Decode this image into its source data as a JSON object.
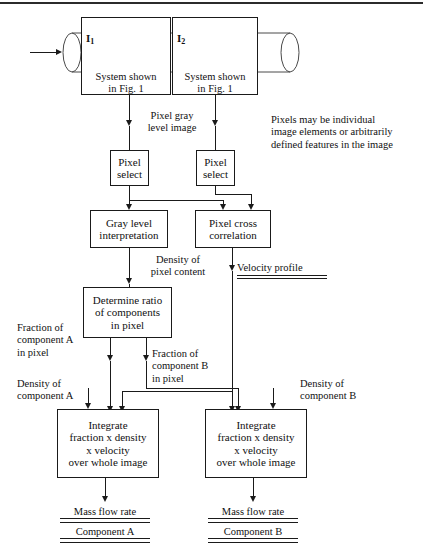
{
  "diagram": {
    "pipe": {
      "inlet_arrow": "flow-inlet-arrow",
      "bubble_left": "bubble-glyph",
      "bubble_right": "bubble-glyph"
    },
    "plane_labels": {
      "left": "I",
      "left_sub": "1",
      "right": "I",
      "right_sub": "2"
    },
    "boxes": {
      "system_left": "System shown\nin Fig. 1",
      "system_right": "System shown\nin Fig. 1",
      "pixel_select_left": "Pixel\nselect",
      "pixel_select_right": "Pixel\nselect",
      "gray_level": "Gray level\ninterpretation",
      "pixel_cross": "Pixel cross\ncorrelation",
      "determine_ratio": "Determine ratio\nof components\nin pixel",
      "integrate_left": "Integrate\nfraction x density\nx velocity\nover whole image",
      "integrate_right": "Integrate\nfraction x density\nx velocity\nover whole image"
    },
    "labels": {
      "pixel_gray_level_image": "Pixel gray\nlevel image",
      "note_pixels": "Pixels may be individual\nimage elements or arbitrarily\ndefined features in the image",
      "density_pixel_content": "Density of\npixel content",
      "velocity_profile": "Velocity profile",
      "fraction_a": "Fraction of\ncomponent A\nin pixel",
      "fraction_b": "Fraction of\ncomponent B\nin pixel",
      "density_a": "Density of\ncomponent A",
      "density_b": "Density of\ncomponent B"
    },
    "results": {
      "left_line1": "Mass flow rate",
      "left_line2": "Component A",
      "right_line1": "Mass flow rate",
      "right_line2": "Component B"
    },
    "colors": {
      "stroke": "#1a1a1a",
      "background": "#ffffff",
      "text": "#111111"
    }
  }
}
